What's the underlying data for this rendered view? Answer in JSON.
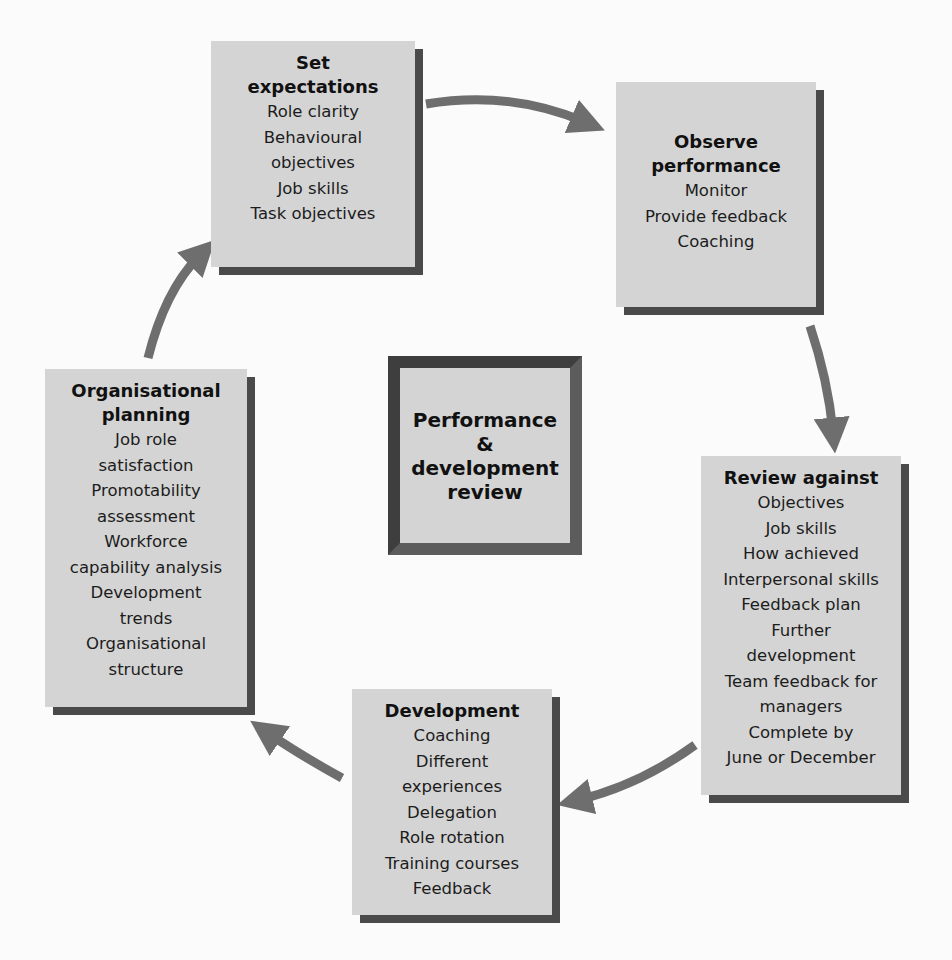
{
  "diagram": {
    "type": "cycle",
    "center": {
      "title_lines": [
        "Performance",
        "&",
        "development",
        "review"
      ]
    },
    "stages": [
      {
        "id": "set-expectations",
        "title_lines": [
          "Set",
          "expectations"
        ],
        "items": [
          "Role clarity",
          "Behavioural",
          "objectives",
          "Job skills",
          "Task objectives"
        ]
      },
      {
        "id": "observe-performance",
        "title_lines": [
          "Observe",
          "performance"
        ],
        "items": [
          "Monitor",
          "Provide feedback",
          "Coaching"
        ]
      },
      {
        "id": "review-against",
        "title_lines": [
          "Review against"
        ],
        "items": [
          "Objectives",
          "Job skills",
          "How achieved",
          "Interpersonal skills",
          "Feedback plan",
          "Further",
          "development",
          "Team feedback for",
          "managers",
          "Complete by",
          "June or December"
        ]
      },
      {
        "id": "development",
        "title_lines": [
          "Development"
        ],
        "items": [
          "Coaching",
          "Different",
          "experiences",
          "Delegation",
          "Role rotation",
          "Training courses",
          "Feedback"
        ]
      },
      {
        "id": "organisational-planning",
        "title_lines": [
          "Organisational",
          "planning"
        ],
        "items": [
          "Job role",
          "satisfaction",
          "Promotability",
          "assessment",
          "Workforce",
          "capability analysis",
          "Development",
          "trends",
          "Organisational",
          "structure"
        ]
      }
    ],
    "arrows": [
      {
        "from": "set-expectations",
        "to": "observe-performance"
      },
      {
        "from": "observe-performance",
        "to": "review-against"
      },
      {
        "from": "review-against",
        "to": "development"
      },
      {
        "from": "development",
        "to": "organisational-planning"
      },
      {
        "from": "organisational-planning",
        "to": "set-expectations"
      }
    ],
    "colors": {
      "box_fill": "#d4d4d4",
      "box_shadow": "#4a4a4a",
      "arrow": "#6e6e6e",
      "text": "#1a1a1a",
      "background": "#fbfbfb"
    }
  }
}
